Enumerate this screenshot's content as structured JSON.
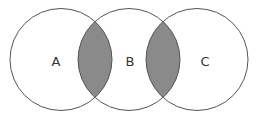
{
  "diagram": {
    "type": "venn",
    "sets": [
      {
        "id": "A",
        "label": "A",
        "cx": 61,
        "cy": 59.5,
        "r": 51
      },
      {
        "id": "B",
        "label": "B",
        "cx": 129,
        "cy": 59.5,
        "r": 51
      },
      {
        "id": "C",
        "label": "C",
        "cx": 197,
        "cy": 59.5,
        "r": 51
      }
    ],
    "highlighted_regions": [
      "A∩B",
      "B∩C"
    ],
    "colors": {
      "background": "#ffffff",
      "stroke": "#555555",
      "highlight_fill": "#8a8a8a",
      "label": "#333333"
    }
  }
}
